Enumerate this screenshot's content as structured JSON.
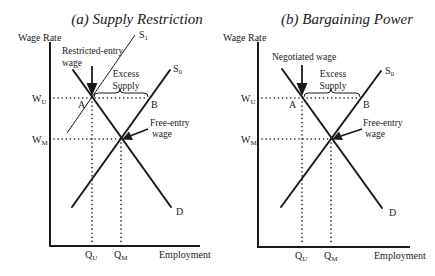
{
  "panels": [
    {
      "title": "(a) Supply Restriction",
      "y_axis_label": "Wage Rate",
      "x_axis_label": "Employment",
      "wage_upper": {
        "base": "W",
        "sub": "U"
      },
      "wage_market": {
        "base": "W",
        "sub": "M"
      },
      "qty_union": {
        "base": "Q",
        "sub": "U"
      },
      "qty_market": {
        "base": "Q",
        "sub": "M"
      },
      "demand_label": "D",
      "supply0": {
        "base": "S",
        "sub": "0"
      },
      "supply1": {
        "base": "S",
        "sub": "1"
      },
      "point_a": "A",
      "point_b": "B",
      "top_annotation": [
        "Restricted-entry",
        "wage"
      ],
      "excess_annotation": [
        "Excess",
        "Supply"
      ],
      "free_entry_annotation": [
        "Free-entry",
        "wage"
      ]
    },
    {
      "title": "(b) Bargaining Power",
      "y_axis_label": "Wage Rate",
      "x_axis_label": "Employment",
      "wage_upper": {
        "base": "W",
        "sub": "U"
      },
      "wage_market": {
        "base": "W",
        "sub": "M"
      },
      "qty_union": {
        "base": "Q",
        "sub": "U"
      },
      "qty_market": {
        "base": "Q",
        "sub": "M"
      },
      "demand_label": "D",
      "supply0": {
        "base": "S",
        "sub": "0"
      },
      "point_a": "A",
      "point_b": "B",
      "top_annotation": [
        "Negotiated wage"
      ],
      "excess_annotation": [
        "Excess",
        "Supply"
      ],
      "free_entry_annotation": [
        "Free-entry",
        "wage"
      ]
    }
  ]
}
